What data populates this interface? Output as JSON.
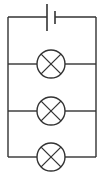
{
  "diagram": {
    "type": "circuit-schematic",
    "colors": {
      "line": "#333333",
      "background": "#ffffff"
    },
    "components": [
      {
        "id": "cell",
        "kind": "battery-cell",
        "icon": "battery-cell-icon"
      },
      {
        "id": "lamp-1",
        "kind": "lamp",
        "icon": "lamp-icon"
      },
      {
        "id": "lamp-2",
        "kind": "lamp",
        "icon": "lamp-icon"
      },
      {
        "id": "lamp-3",
        "kind": "lamp",
        "icon": "lamp-icon"
      }
    ],
    "connection": "parallel"
  }
}
